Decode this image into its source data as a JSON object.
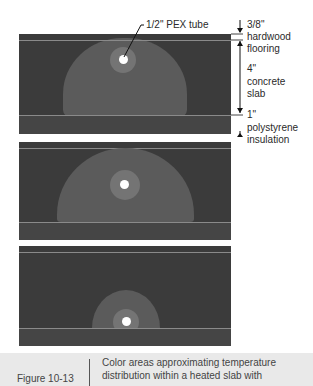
{
  "figure": {
    "number": "Figure 10-13",
    "caption_lines": [
      "Color areas approximating temperature",
      "distribution within a heated slab with"
    ]
  },
  "labels": {
    "tube": "1/2\" PEX tube",
    "hardwood_size": "3/8\"",
    "hardwood_line1": "hardwood",
    "hardwood_line2": "flooring",
    "concrete_size": "4\"",
    "concrete_line1": "concrete",
    "concrete_line2": "slab",
    "insulation_size": "1\"",
    "insulation_line1": "polystyrene",
    "insulation_line2": "insulation"
  },
  "layers": [
    {
      "name": "hardwood flooring",
      "thickness": "3/8\""
    },
    {
      "name": "concrete slab",
      "thickness": "4\""
    },
    {
      "name": "polystyrene insulation",
      "thickness": "1\""
    }
  ],
  "panels": [
    {
      "id": "tube-high",
      "tube_position": "upper slab"
    },
    {
      "id": "tube-mid",
      "tube_position": "mid slab"
    },
    {
      "id": "tube-low",
      "tube_position": "bottom of slab"
    }
  ],
  "colors": {
    "slab_background": "#3b3b3b",
    "warm_zone": "#5b5b5b",
    "hot_zone": "#747474",
    "tube": "#ffffff",
    "caption_background": "#e9e9e9"
  }
}
